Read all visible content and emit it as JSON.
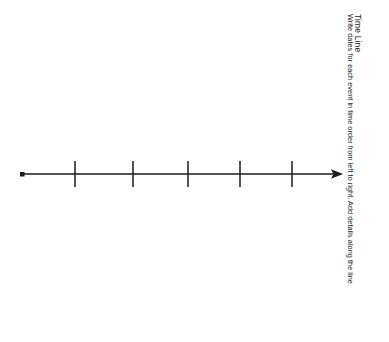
{
  "worksheet": {
    "title": "Time Line",
    "instructions": "Write dates for each event in time order from left to right. Add details along the line.",
    "background_color": "#ffffff",
    "ink_color": "#1a1a1a"
  },
  "timeline": {
    "axis": {
      "start_x": 22,
      "end_x": 343,
      "y": 174,
      "stroke_width": 1.6
    },
    "start_marker": {
      "name": "start-dot",
      "shape": "square",
      "x": 22,
      "y": 174,
      "size": 4
    },
    "end_marker": {
      "name": "arrowhead",
      "shape": "triangle",
      "tip_x": 343,
      "y": 174,
      "length": 11,
      "half_height": 4.5
    },
    "tick_count": 5,
    "tick_height": 26,
    "ticks": [
      {
        "label": "",
        "x": 75
      },
      {
        "label": "",
        "x": 133
      },
      {
        "label": "",
        "x": 188
      },
      {
        "label": "",
        "x": 240
      },
      {
        "label": "",
        "x": 292
      }
    ]
  }
}
